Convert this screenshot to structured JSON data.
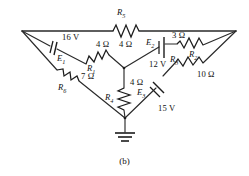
{
  "figure": {
    "caption": "(b)",
    "type": "electrical-circuit-schematic",
    "ground_symbol": "earth-ground"
  },
  "sources": [
    {
      "id": "E1",
      "name": "E",
      "sub": "1",
      "voltage": "16 V",
      "orientation": "diagonal"
    },
    {
      "id": "E2",
      "name": "E",
      "sub": "2",
      "voltage": "12 V",
      "orientation": "vertical"
    },
    {
      "id": "E3",
      "name": "E",
      "sub": "3",
      "voltage": "15 V",
      "orientation": "diagonal"
    }
  ],
  "resistors": [
    {
      "id": "R1",
      "name": "R",
      "sub": "1",
      "value": "4 Ω"
    },
    {
      "id": "R2",
      "name": "R",
      "sub": "2",
      "value": "3 Ω"
    },
    {
      "id": "R3",
      "name": "R",
      "sub": "3",
      "value": "10  Ω"
    },
    {
      "id": "R4",
      "name": "R",
      "sub": "4",
      "value": "4 Ω"
    },
    {
      "id": "R5",
      "name": "R",
      "sub": "5",
      "value": "4 Ω"
    },
    {
      "id": "R6",
      "name": "R",
      "sub": "6",
      "value": "7 Ω"
    }
  ],
  "labels": {
    "R5_name": "R",
    "R5_sub": "5",
    "R5_value": "4 Ω",
    "R1_name": "R",
    "R1_sub": "1",
    "R1_value": "4 Ω",
    "R2_name": "R",
    "R2_sub": "2",
    "R2_value": "3 Ω",
    "R3_name": "R",
    "R3_sub": "3",
    "R3_value": "10  Ω",
    "R4_name": "R",
    "R4_sub": "4",
    "R4_value": "4 Ω",
    "R6_name": "R",
    "R6_sub": "6",
    "R6_value": "7 Ω",
    "E1_name": "E",
    "E1_sub": "1",
    "E1_value": "16 V",
    "E2_name": "E",
    "E2_sub": "2",
    "E2_value": "12 V",
    "E3_name": "E",
    "E3_sub": "3",
    "E3_value": "15 V"
  },
  "colors": {
    "wire": "#2a2a2a",
    "text": "#111111",
    "background": "#ffffff"
  }
}
